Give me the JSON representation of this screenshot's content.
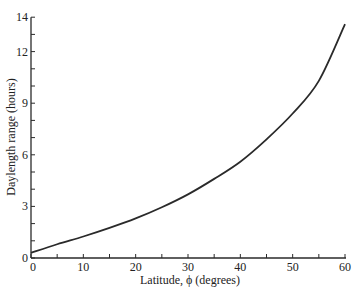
{
  "chart_data": {
    "type": "line",
    "title": "",
    "xlabel": "Latitude, ϕ (degrees)",
    "ylabel": "Daylength range (hours)",
    "xlim": [
      0,
      60
    ],
    "ylim": [
      0,
      14
    ],
    "x_ticks": [
      0,
      10,
      20,
      30,
      40,
      50,
      60
    ],
    "x_minor_ticks": [
      5,
      15,
      25,
      35,
      45,
      55
    ],
    "y_ticks": [
      0,
      3,
      6,
      9,
      12,
      14
    ],
    "y_minor_ticks": [
      1,
      2,
      4,
      5,
      7,
      8,
      10,
      11,
      13
    ],
    "grid": false,
    "legend": null,
    "series": [
      {
        "name": "Daylength range",
        "x": [
          0,
          5,
          10,
          15,
          20,
          25,
          30,
          35,
          40,
          45,
          50,
          55,
          60
        ],
        "values": [
          0.3,
          0.8,
          1.25,
          1.75,
          2.3,
          2.95,
          3.7,
          4.6,
          5.6,
          6.9,
          8.4,
          10.3,
          13.6
        ]
      }
    ]
  }
}
